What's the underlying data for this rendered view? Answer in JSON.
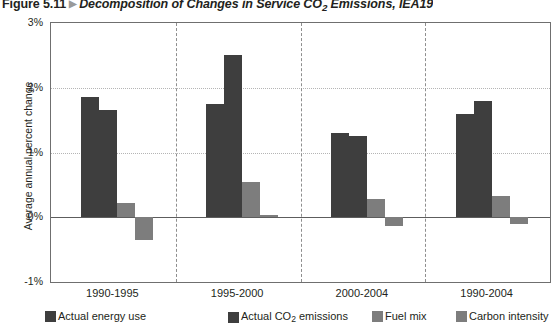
{
  "figure": {
    "number": "Figure 5.11",
    "marker": "▶",
    "title_pre": "Decomposition of Changes in Service CO",
    "title_sub": "2",
    "title_post": " Emissions, IEA19"
  },
  "chart_data": {
    "type": "bar",
    "title": "Decomposition of Changes in Service CO2 Emissions, IEA19",
    "xlabel": "",
    "ylabel": "Average annual percent change",
    "categories": [
      "1990-1995",
      "1995-2000",
      "2000-2004",
      "1990-2004"
    ],
    "series": [
      {
        "name": "Actual energy use",
        "color": "#3e3e3e",
        "values": [
          1.85,
          1.75,
          1.3,
          1.6
        ]
      },
      {
        "name": "Actual CO2 emissions",
        "color": "#3e3e3e",
        "values": [
          1.65,
          2.5,
          1.25,
          1.8
        ]
      },
      {
        "name": "Fuel mix",
        "color": "#7d7d7d",
        "values": [
          0.22,
          0.55,
          0.28,
          0.33
        ]
      },
      {
        "name": "Carbon intensity",
        "color": "#7d7d7d",
        "values": [
          -0.35,
          0.04,
          -0.14,
          -0.1
        ]
      }
    ],
    "ylim": [
      -1,
      3
    ],
    "yticks": [
      3,
      2,
      1,
      0,
      -1
    ],
    "ytick_labels": [
      "3%",
      "2%",
      "1%",
      "0%",
      "-1%"
    ],
    "grid": true,
    "grid_values": [
      2,
      1
    ],
    "zero_value": 0,
    "legend_position": "bottom",
    "group_separators": 3
  },
  "legend": {
    "items": [
      {
        "label": "Actual energy use",
        "color": "#3e3e3e",
        "sub": ""
      },
      {
        "label_pre": "Actual CO",
        "label_sub": "2",
        "label_post": " emissions",
        "label": "Actual CO2 emissions",
        "color": "#3e3e3e"
      },
      {
        "label": "Fuel mix",
        "color": "#7d7d7d"
      },
      {
        "label": "Carbon intensity",
        "color": "#7d7d7d"
      }
    ]
  }
}
